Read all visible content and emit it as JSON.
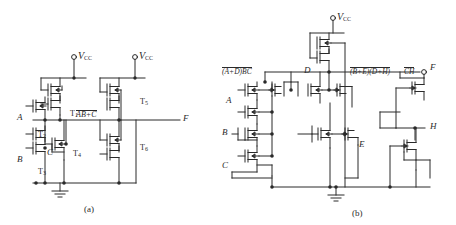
{
  "figure": {
    "panels": [
      {
        "id": "a",
        "caption": "(a)",
        "supplies": [
          {
            "name": "supply-left",
            "label": "V",
            "subscript": "CC"
          },
          {
            "name": "supply-right",
            "label": "V",
            "subscript": "CC"
          }
        ],
        "inputs": [
          {
            "name": "input-a",
            "label": "A"
          },
          {
            "name": "input-b",
            "label": "B"
          },
          {
            "name": "input-c",
            "label": "C"
          }
        ],
        "outputs": [
          {
            "name": "output-f",
            "label": "F"
          }
        ],
        "node_labels": [
          {
            "name": "intermediate-node",
            "text": "AB+C",
            "overline": true
          }
        ],
        "transistors": [
          {
            "name": "transistor-t1",
            "label": "T",
            "subscript": "1"
          },
          {
            "name": "transistor-t2",
            "label": "T",
            "subscript": "2"
          },
          {
            "name": "transistor-t3",
            "label": "T",
            "subscript": "3"
          },
          {
            "name": "transistor-t4",
            "label": "T",
            "subscript": "4"
          },
          {
            "name": "transistor-t5",
            "label": "T",
            "subscript": "5"
          },
          {
            "name": "transistor-t6",
            "label": "T",
            "subscript": "6"
          }
        ]
      },
      {
        "id": "b",
        "caption": "(b)",
        "supplies": [
          {
            "name": "supply-top",
            "label": "V",
            "subscript": "CC"
          }
        ],
        "inputs": [
          {
            "name": "input-a",
            "label": "A"
          },
          {
            "name": "input-b",
            "label": "B"
          },
          {
            "name": "input-c",
            "label": "C"
          },
          {
            "name": "input-d",
            "label": "D"
          },
          {
            "name": "input-e",
            "label": "E"
          }
        ],
        "outputs": [
          {
            "name": "output-f",
            "label": "F"
          },
          {
            "name": "output-h",
            "label": "H"
          }
        ],
        "node_labels": [
          {
            "name": "expr-left",
            "text": "(A+D)BC",
            "overline": true
          },
          {
            "name": "expr-middle",
            "text": "(B+E)(D+H)",
            "overline": true
          },
          {
            "name": "expr-right",
            "text": "CH",
            "overline": true
          }
        ]
      }
    ]
  },
  "colors": {
    "ink": "#2a2a2a",
    "background": "#ffffff"
  }
}
